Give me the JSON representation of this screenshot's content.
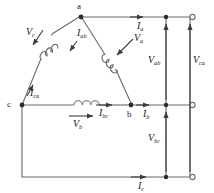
{
  "figure": {
    "type": "delta-connected three-phase circuit diagram",
    "stroke_color": "#4d4d4d",
    "text_color": "#1a1a1a",
    "background": "#ffffff"
  },
  "nodes": [
    {
      "id": "a",
      "label": "a"
    },
    {
      "id": "b",
      "label": "b"
    },
    {
      "id": "c",
      "label": "c"
    }
  ],
  "phase_voltages": [
    {
      "id": "Vc",
      "base": "V",
      "sub": "c"
    },
    {
      "id": "Va",
      "base": "V",
      "sub": "a"
    },
    {
      "id": "Vb",
      "base": "V",
      "sub": "b"
    }
  ],
  "phase_currents": [
    {
      "id": "Iab",
      "base": "I",
      "sub": "ab"
    },
    {
      "id": "Ibc",
      "base": "I",
      "sub": "bc"
    },
    {
      "id": "Ica",
      "base": "I",
      "sub": "ca"
    }
  ],
  "line_currents": [
    {
      "id": "Ia",
      "base": "I",
      "sub": "a"
    },
    {
      "id": "Ib",
      "base": "I",
      "sub": "b"
    },
    {
      "id": "Ic",
      "base": "I",
      "sub": "c"
    }
  ],
  "line_voltages": [
    {
      "id": "Vab",
      "base": "V",
      "sub": "ab"
    },
    {
      "id": "Vbc",
      "base": "V",
      "sub": "bc"
    },
    {
      "id": "Vca",
      "base": "V",
      "sub": "ca"
    }
  ],
  "terminals": [
    {
      "id": "terminal-top"
    },
    {
      "id": "terminal-middle"
    },
    {
      "id": "terminal-bottom"
    }
  ]
}
